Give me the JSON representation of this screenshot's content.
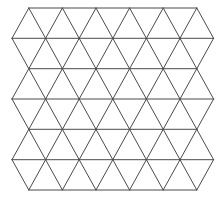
{
  "diagram": {
    "type": "triangular-lattice",
    "shape": "hexagon-like (flat top/bottom, pointed left/right sides)",
    "background": "#ffffff",
    "line_color": "#4a4a4a",
    "line_width": 1,
    "row_y": [
      8,
      38.3,
      68.7,
      99,
      129.3,
      159.7,
      190
    ],
    "even_row_x": [
      12,
      45.6,
      79.2,
      112.8,
      146.4,
      180,
      213.6
    ],
    "odd_row_x": [
      28.8,
      62.4,
      96,
      129.6,
      163.2,
      196.8
    ],
    "rows": 7,
    "triangle_bands": 6,
    "first_row_parity": "odd"
  }
}
